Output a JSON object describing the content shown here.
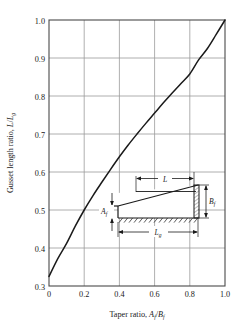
{
  "chart_data": {
    "type": "line",
    "title": "",
    "subtitle": "",
    "xlabel": "Taper ratio, A_f/B_f",
    "xlabel_parts": {
      "prefix": "Taper ratio, ",
      "num_base": "A",
      "num_sub": "f",
      "slash": "/",
      "den_base": "B",
      "den_sub": "f"
    },
    "ylabel": "Gusset length ratio, L/L_g",
    "ylabel_parts": {
      "prefix": "Gusset length ratio, ",
      "num_base": "L",
      "slash": "/",
      "den_base": "L",
      "den_sub": "g"
    },
    "xlim": [
      0,
      1.0
    ],
    "ylim": [
      0.3,
      1.0
    ],
    "xticks": [
      "0",
      "0.2",
      "0.4",
      "0.6",
      "0.8",
      "1.0"
    ],
    "xtick_values": [
      0,
      0.2,
      0.4,
      0.6,
      0.8,
      1.0
    ],
    "yticks": [
      "0.3",
      "0.4",
      "0.5",
      "0.6",
      "0.7",
      "0.8",
      "0.9",
      "1.0"
    ],
    "ytick_values": [
      0.3,
      0.4,
      0.5,
      0.6,
      0.7,
      0.8,
      0.9,
      1.0
    ],
    "grid": true,
    "grid_color": "#9a9a9a",
    "line_color": "#1a1a1a",
    "legend": "none",
    "series": [
      {
        "name": "Gusset length ratio vs taper ratio",
        "x": [
          0.0,
          0.05,
          0.1,
          0.15,
          0.2,
          0.25,
          0.3,
          0.35,
          0.4,
          0.45,
          0.5,
          0.55,
          0.6,
          0.65,
          0.7,
          0.75,
          0.8,
          0.85,
          0.9,
          0.95,
          1.0
        ],
        "values": [
          0.325,
          0.372,
          0.412,
          0.458,
          0.5,
          0.538,
          0.573,
          0.607,
          0.64,
          0.671,
          0.7,
          0.728,
          0.755,
          0.782,
          0.808,
          0.833,
          0.858,
          0.895,
          0.925,
          0.962,
          1.0
        ]
      }
    ]
  },
  "inset": {
    "name": "gusset-plate-detail-diagram",
    "labels": {
      "L": "L",
      "Lg_base": "L",
      "Lg_sub": "g",
      "Af_base": "A",
      "Af_sub": "f",
      "Bf_base": "B",
      "Bf_sub": "f"
    }
  }
}
